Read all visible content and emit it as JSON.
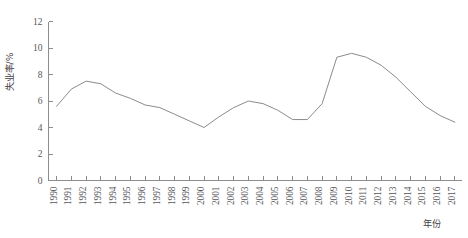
{
  "chart_data": {
    "type": "line",
    "title": "",
    "xlabel": "年份",
    "ylabel": "失业率/%",
    "xlim": [
      1990,
      2017
    ],
    "ylim": [
      0,
      12
    ],
    "grid": false,
    "legend": false,
    "line_color": "#8a8b90",
    "axis_color": "#8c8d91",
    "ytick_labels": [
      "12",
      "10",
      "8",
      "6",
      "4",
      "2",
      "0"
    ],
    "ytick_values": [
      12,
      10,
      8,
      6,
      4,
      2,
      0
    ],
    "categories": [
      "1990",
      "1991",
      "1992",
      "1993",
      "1994",
      "1995",
      "1996",
      "1997",
      "1998",
      "1999",
      "2000",
      "2001",
      "2002",
      "2003",
      "2004",
      "2005",
      "2006",
      "2007",
      "2008",
      "2009",
      "2010",
      "2011",
      "2012",
      "2013",
      "2014",
      "2015",
      "2016",
      "2017"
    ],
    "x": [
      1990,
      1991,
      1992,
      1993,
      1994,
      1995,
      1996,
      1997,
      1998,
      1999,
      2000,
      2001,
      2002,
      2003,
      2004,
      2005,
      2006,
      2007,
      2008,
      2009,
      2010,
      2011,
      2012,
      2013,
      2014,
      2015,
      2016,
      2017
    ],
    "values": [
      5.6,
      6.9,
      7.5,
      7.3,
      6.6,
      6.2,
      5.7,
      5.5,
      5.0,
      4.5,
      4.0,
      4.8,
      5.5,
      6.0,
      5.8,
      5.3,
      4.6,
      4.6,
      5.8,
      9.3,
      9.6,
      9.3,
      8.7,
      7.8,
      6.7,
      5.6,
      4.9,
      4.4
    ]
  },
  "axes": {
    "y_title": "失业率/%",
    "x_title": "年份"
  }
}
